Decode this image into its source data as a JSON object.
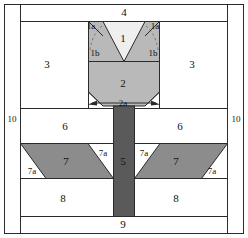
{
  "diagram": {
    "canvas": {
      "width": 248,
      "height": 238
    },
    "colors": {
      "background": "#ffffff",
      "outline": "#2b2b2b",
      "light_piece": "#efefef",
      "medium_piece": "#b9b9b9",
      "dark_piece": "#8c8c8c",
      "stem": "#5a5a5a",
      "label_text": "#111111",
      "dashed_guide": "#6f6f6f"
    },
    "pieces": {
      "petal_center": {
        "label": "1",
        "shade": "light"
      },
      "petal_tip_left": {
        "label": "1a",
        "shade": "medium"
      },
      "petal_tip_right": {
        "label": "1a",
        "shade": "medium"
      },
      "petal_side_left": {
        "label": "1b",
        "shade": "medium"
      },
      "petal_side_right": {
        "label": "1b",
        "shade": "medium"
      },
      "flower_base": {
        "label": "2",
        "shade": "medium"
      },
      "flower_base_corner": {
        "label": "2a",
        "shade": "medium"
      },
      "background_left": {
        "label": "3",
        "shade": "white"
      },
      "background_right": {
        "label": "3",
        "shade": "white"
      },
      "top_strip": {
        "label": "4",
        "shade": "white"
      },
      "stem": {
        "label": "5",
        "shade": "stem"
      },
      "upper_leaf_bg_left": {
        "label": "6",
        "shade": "white"
      },
      "upper_leaf_bg_right": {
        "label": "6",
        "shade": "white"
      },
      "leaf_left": {
        "label": "7",
        "shade": "dark"
      },
      "leaf_right": {
        "label": "7",
        "shade": "dark"
      },
      "leaf_corner_outer_left": {
        "label": "7a",
        "shade": "white"
      },
      "leaf_corner_inner_left": {
        "label": "7a",
        "shade": "white"
      },
      "leaf_corner_inner_right": {
        "label": "7a",
        "shade": "white"
      },
      "leaf_corner_outer_right": {
        "label": "7a",
        "shade": "white"
      },
      "lower_bg_left": {
        "label": "8",
        "shade": "white"
      },
      "lower_bg_right": {
        "label": "8",
        "shade": "white"
      },
      "bottom_strip": {
        "label": "9",
        "shade": "white"
      },
      "border_left": {
        "label": "10",
        "shade": "white"
      },
      "border_right": {
        "label": "10",
        "shade": "white"
      }
    },
    "labels": [
      {
        "name": "label-4",
        "text": "4",
        "x": 124,
        "y": 13,
        "size": "normal"
      },
      {
        "name": "label-1a-left",
        "text": "1a",
        "x": 91,
        "y": 27,
        "size": "small"
      },
      {
        "name": "label-1a-right",
        "text": "1a",
        "x": 155,
        "y": 27,
        "size": "small"
      },
      {
        "name": "label-1",
        "text": "1",
        "x": 123,
        "y": 39,
        "size": "normal"
      },
      {
        "name": "label-1b-left",
        "text": "1b",
        "x": 95,
        "y": 54,
        "size": "small"
      },
      {
        "name": "label-1b-right",
        "text": "1b",
        "x": 153,
        "y": 54,
        "size": "small"
      },
      {
        "name": "label-3-left",
        "text": "3",
        "x": 47,
        "y": 65,
        "size": "normal"
      },
      {
        "name": "label-3-right",
        "text": "3",
        "x": 192,
        "y": 65,
        "size": "normal"
      },
      {
        "name": "label-2",
        "text": "2",
        "x": 123,
        "y": 84,
        "size": "normal"
      },
      {
        "name": "label-2a",
        "text": "2a",
        "x": 123,
        "y": 104,
        "size": "small"
      },
      {
        "name": "label-10-left",
        "text": "10",
        "x": 12,
        "y": 120,
        "size": "small"
      },
      {
        "name": "label-10-right",
        "text": "10",
        "x": 236,
        "y": 120,
        "size": "small"
      },
      {
        "name": "label-6-left",
        "text": "6",
        "x": 65,
        "y": 127,
        "size": "normal"
      },
      {
        "name": "label-6-right",
        "text": "6",
        "x": 180,
        "y": 127,
        "size": "normal"
      },
      {
        "name": "label-7-left",
        "text": "7",
        "x": 66,
        "y": 162,
        "size": "normal"
      },
      {
        "name": "label-7-right",
        "text": "7",
        "x": 176,
        "y": 162,
        "size": "normal"
      },
      {
        "name": "label-7a-outer-left",
        "text": "7a",
        "x": 32,
        "y": 172,
        "size": "small"
      },
      {
        "name": "label-7a-inner-left",
        "text": "7a",
        "x": 103,
        "y": 154,
        "size": "small"
      },
      {
        "name": "label-7a-inner-right",
        "text": "7a",
        "x": 144,
        "y": 154,
        "size": "small"
      },
      {
        "name": "label-7a-outer-right",
        "text": "7a",
        "x": 212,
        "y": 172,
        "size": "small"
      },
      {
        "name": "label-5",
        "text": "5",
        "x": 123,
        "y": 162,
        "size": "normal"
      },
      {
        "name": "label-8-left",
        "text": "8",
        "x": 63,
        "y": 199,
        "size": "normal"
      },
      {
        "name": "label-8-right",
        "text": "8",
        "x": 176,
        "y": 199,
        "size": "normal"
      },
      {
        "name": "label-9",
        "text": "9",
        "x": 123,
        "y": 225,
        "size": "normal"
      }
    ]
  }
}
